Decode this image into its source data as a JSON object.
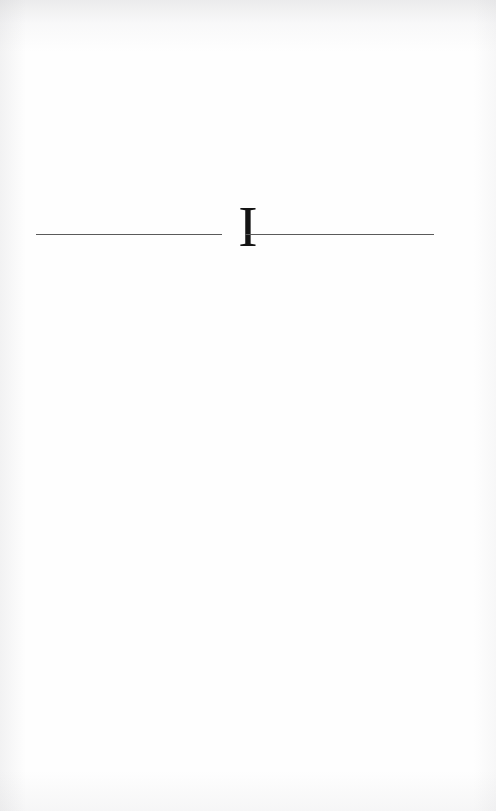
{
  "page": {
    "kind": "book-part-divider",
    "background_color": "#fefefe",
    "width": 496,
    "height": 811
  },
  "divider": {
    "numeral": "I",
    "numeral_color": "#141414",
    "rule_color": "#5a5a5a",
    "left_rule_label": "left-horizontal-rule",
    "right_rule_label": "right-horizontal-rule"
  }
}
